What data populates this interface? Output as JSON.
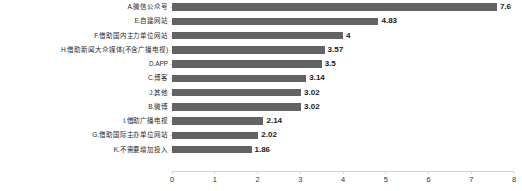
{
  "chart_data": {
    "type": "bar",
    "orientation": "horizontal",
    "title": "",
    "xlabel": "",
    "ylabel": "",
    "xlim": [
      0,
      8
    ],
    "grid": false,
    "legend": false,
    "bar_color": "#636363",
    "axis_color": "#d4d4d4",
    "xticks": [
      "0",
      "1",
      "2",
      "3",
      "4",
      "5",
      "6",
      "7",
      "8"
    ],
    "xtick_values": [
      0,
      1,
      2,
      3,
      4,
      5,
      6,
      7,
      8
    ],
    "categories": [
      "A.微信公众号",
      "E.自建网站",
      "F.借助国内主力单位网站",
      "H.借助新闻大众媒体(不含广播电视)",
      "D.APP",
      "C.博客",
      "J.其他",
      "B.微博",
      "I.借助广播电视",
      "G.借助国际主办单位网站",
      "K.不需要增加投入"
    ],
    "values": [
      7.6,
      4.83,
      4,
      3.57,
      3.5,
      3.14,
      3.02,
      3.02,
      2.14,
      2.02,
      1.86
    ],
    "value_labels": [
      "7.6",
      "4.83",
      "4",
      "3.57",
      "3.5",
      "3.14",
      "3.02",
      "3.02",
      "2.14",
      "2.02",
      "1.86"
    ]
  }
}
